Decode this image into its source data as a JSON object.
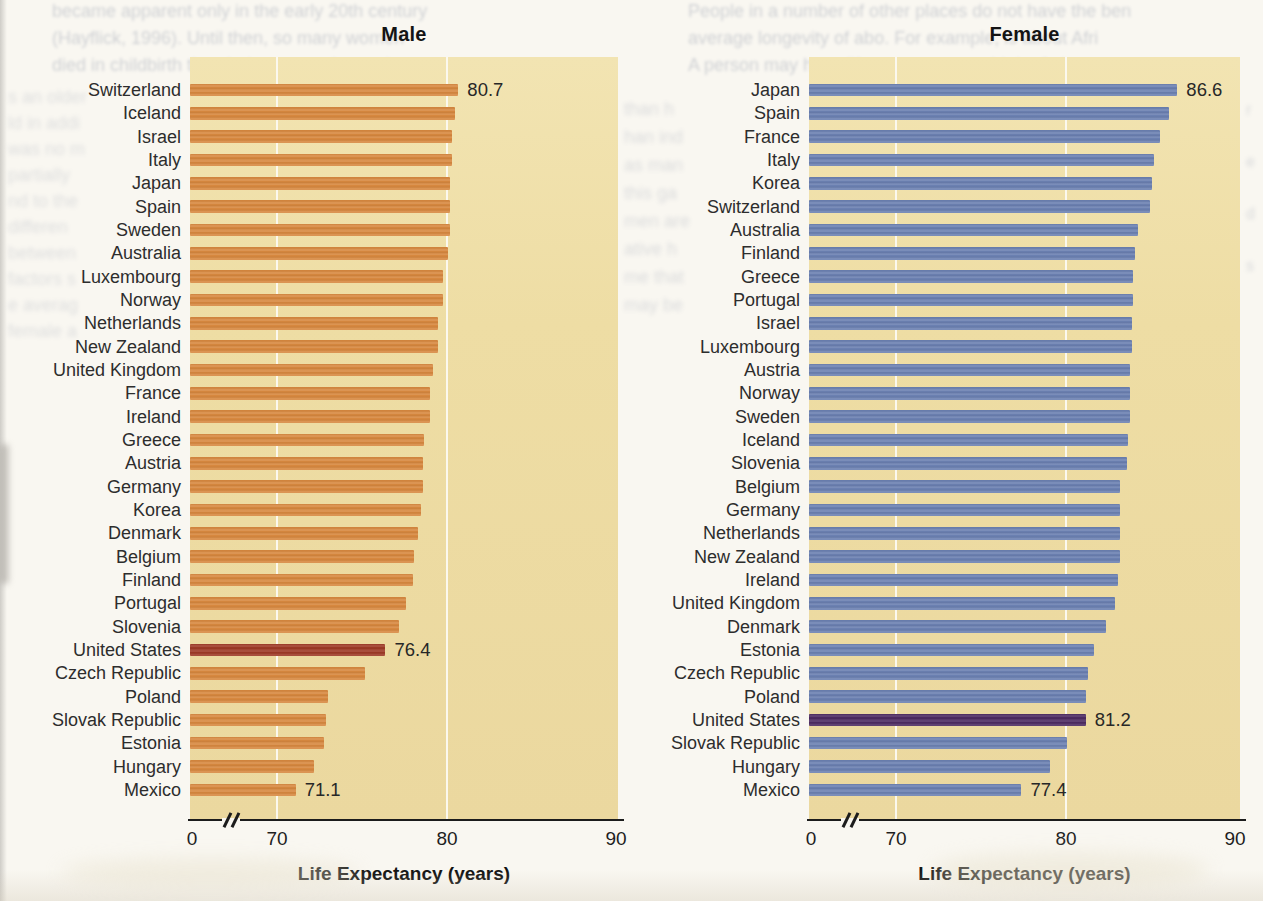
{
  "page": {
    "background_color": "#f9f7f1",
    "bleedthrough": {
      "top_left_lines": [
        "became apparent only in the early 20th century",
        "(Hayflick, 1996). Until then, so many women",
        "died in childbirth that their average longevity"
      ],
      "left_column_lines": [
        "s an older",
        "ld in addi",
        "was no m",
        "partially",
        "nd to the",
        "differen",
        "between",
        "factors s",
        "e averag",
        "female a"
      ],
      "top_right_lines": [
        "People in a number of other places do not have the ben",
        "average longevity of abo. For example, is about Afri",
        "A person may have life expectancy at birth of about"
      ],
      "between_charts_lines": [
        "than h",
        "han ind",
        "as man",
        "this ga",
        "men are",
        "ative h",
        "me that",
        "may be"
      ],
      "right_edge_lines": [
        "r",
        "e",
        "d",
        "s"
      ]
    }
  },
  "chart_data": [
    {
      "type": "bar",
      "orientation": "horizontal",
      "title": "Male",
      "xlabel": "Life Expectancy (years)",
      "plot_bg": "#EEDDA4",
      "bar_color": "#D7883F",
      "highlight_color": "#9E3A26",
      "highlight_category": "United States",
      "axis": {
        "tick_labels": [
          "0",
          "70",
          "80",
          "90"
        ],
        "tick_values": [
          0,
          70,
          80,
          90
        ],
        "break_after_zero": true,
        "displayed_range": [
          70,
          90
        ],
        "gridlines_at": [
          70,
          80
        ],
        "gridline_color": "#fbf8ee"
      },
      "categories": [
        "Switzerland",
        "Iceland",
        "Israel",
        "Italy",
        "Japan",
        "Spain",
        "Sweden",
        "Australia",
        "Luxembourg",
        "Norway",
        "Netherlands",
        "New Zealand",
        "United Kingdom",
        "France",
        "Ireland",
        "Greece",
        "Austria",
        "Germany",
        "Korea",
        "Denmark",
        "Belgium",
        "Finland",
        "Portugal",
        "Slovenia",
        "United States",
        "Czech Republic",
        "Poland",
        "Slovak Republic",
        "Estonia",
        "Hungary",
        "Mexico"
      ],
      "values": [
        80.7,
        80.5,
        80.3,
        80.3,
        80.2,
        80.2,
        80.2,
        80.1,
        79.8,
        79.8,
        79.5,
        79.5,
        79.2,
        79.0,
        79.0,
        78.7,
        78.6,
        78.6,
        78.5,
        78.3,
        78.1,
        78.0,
        77.6,
        77.2,
        76.4,
        75.2,
        73.0,
        72.9,
        72.8,
        72.2,
        71.1
      ],
      "annotations": [
        {
          "category": "Switzerland",
          "label": "80.7"
        },
        {
          "category": "United States",
          "label": "76.4"
        },
        {
          "category": "Mexico",
          "label": "71.1"
        }
      ]
    },
    {
      "type": "bar",
      "orientation": "horizontal",
      "title": "Female",
      "xlabel": "Life Expectancy (years)",
      "plot_bg": "#EEDDA4",
      "bar_color": "#6B80B1",
      "highlight_color": "#4D2B62",
      "highlight_category": "United States",
      "axis": {
        "tick_labels": [
          "0",
          "70",
          "80",
          "90"
        ],
        "tick_values": [
          0,
          70,
          80,
          90
        ],
        "break_after_zero": true,
        "displayed_range": [
          70,
          90
        ],
        "gridlines_at": [
          70,
          80
        ],
        "gridline_color": "#fbf8ee"
      },
      "categories": [
        "Japan",
        "Spain",
        "France",
        "Italy",
        "Korea",
        "Switzerland",
        "Australia",
        "Finland",
        "Greece",
        "Portugal",
        "Israel",
        "Luxembourg",
        "Austria",
        "Norway",
        "Sweden",
        "Iceland",
        "Slovenia",
        "Belgium",
        "Germany",
        "Netherlands",
        "New Zealand",
        "Ireland",
        "United Kingdom",
        "Denmark",
        "Estonia",
        "Czech Republic",
        "Poland",
        "United States",
        "Slovak Republic",
        "Hungary",
        "Mexico"
      ],
      "values": [
        86.6,
        86.1,
        85.6,
        85.2,
        85.1,
        85.0,
        84.3,
        84.1,
        84.0,
        84.0,
        83.9,
        83.9,
        83.8,
        83.8,
        83.8,
        83.7,
        83.6,
        83.2,
        83.2,
        83.2,
        83.2,
        83.1,
        82.9,
        82.4,
        81.7,
        81.3,
        81.2,
        81.2,
        80.1,
        79.1,
        77.4
      ],
      "annotations": [
        {
          "category": "Japan",
          "label": "86.6"
        },
        {
          "category": "United States",
          "label": "81.2"
        },
        {
          "category": "Mexico",
          "label": "77.4"
        }
      ]
    }
  ]
}
